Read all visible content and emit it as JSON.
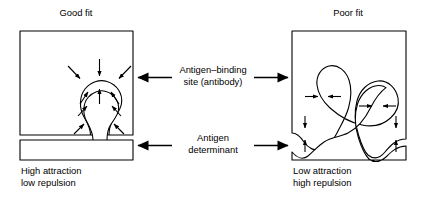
{
  "figure": {
    "title_left": "Good fit",
    "title_right": "Poor fit",
    "caption_left_line1": "High attraction",
    "caption_left_line2": "low repulsion",
    "caption_right_line1": "Low attraction",
    "caption_right_line2": "high repulsion",
    "center_label_1_line1": "Antigen–binding",
    "center_label_1_line2": "site (antibody)",
    "center_label_2_line1": "Antigen",
    "center_label_2_line2": "determinant",
    "colors": {
      "ink": "#000000",
      "paper": "#ffffff"
    },
    "panels": [
      {
        "id": "good-fit",
        "title": "Good fit",
        "antibody_label": "antibody block with binding-site cavity",
        "antigen_label": "antigen bar with determinant protrusion",
        "force_direction": "inward",
        "force_meaning": "attraction",
        "arrow_count": 9
      },
      {
        "id": "poor-fit",
        "title": "Poor fit",
        "antibody_label": "antibody block with mismatched cavity",
        "antigen_label": "antigen bar with mismatched determinant",
        "force_direction": "outward",
        "force_meaning": "repulsion",
        "arrow_count": 8
      }
    ],
    "pointers": [
      {
        "id": "antigen-binding-site",
        "line1": "Antigen–binding",
        "line2": "site (antibody)",
        "points_to": [
          "left-antibody-block",
          "right-antibody-block"
        ]
      },
      {
        "id": "antigen-determinant",
        "line1": "Antigen",
        "line2": "determinant",
        "points_to": [
          "left-antigen-bar",
          "right-antigen-bar"
        ]
      }
    ]
  }
}
